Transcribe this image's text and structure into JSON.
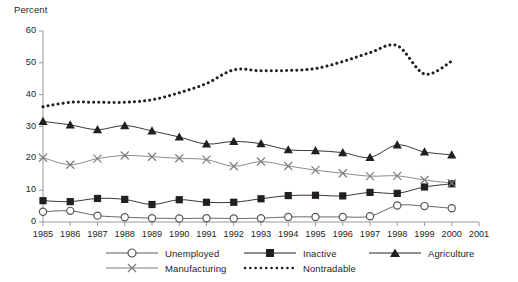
{
  "chart_data": {
    "type": "line",
    "title": "",
    "ylabel": "Percent",
    "xlabel": "",
    "ylim": [
      0,
      60
    ],
    "yticks": [
      0,
      10,
      20,
      30,
      40,
      50,
      60
    ],
    "grid": false,
    "legend_position": "bottom",
    "x": [
      1985,
      1986,
      1987,
      1988,
      1989,
      1990,
      1991,
      1992,
      1993,
      1994,
      1995,
      1996,
      1997,
      1998,
      1999,
      2000
    ],
    "xtick_labels": [
      "1985",
      "1986",
      "1987",
      "1988",
      "1989",
      "1990",
      "1991",
      "1992",
      "1993",
      "1994",
      "1995",
      "1996",
      "1997",
      "1998",
      "1999",
      "2000",
      "2001"
    ],
    "xlim": [
      1985,
      2001
    ],
    "series": [
      {
        "name": "Unemployed",
        "marker": "circle-open",
        "line": "solid",
        "color": "#58585b",
        "values": [
          3.2,
          3.5,
          2.0,
          1.5,
          1.2,
          1.1,
          1.2,
          1.1,
          1.2,
          1.6,
          1.6,
          1.6,
          1.8,
          5.2,
          5.0,
          4.3
        ]
      },
      {
        "name": "Inactive",
        "marker": "square-filled",
        "line": "solid",
        "color": "#231f20",
        "values": [
          6.7,
          6.4,
          7.4,
          7.1,
          5.5,
          7.0,
          6.2,
          6.2,
          7.3,
          8.3,
          8.4,
          8.2,
          9.3,
          9.0,
          11.0,
          12.0
        ]
      },
      {
        "name": "Agriculture",
        "marker": "triangle-filled",
        "line": "solid",
        "color": "#231f20",
        "values": [
          31.6,
          30.5,
          29.0,
          30.3,
          28.6,
          26.7,
          24.5,
          25.3,
          24.6,
          22.7,
          22.4,
          21.8,
          20.3,
          24.2,
          22.0,
          21.1
        ]
      },
      {
        "name": "Manufacturing",
        "marker": "cross-x",
        "line": "solid",
        "color": "#7f7f83",
        "values": [
          20.2,
          18.0,
          19.9,
          20.9,
          20.5,
          20.0,
          19.6,
          17.5,
          19.0,
          17.6,
          16.3,
          15.3,
          14.4,
          14.5,
          13.2,
          12.2
        ]
      },
      {
        "name": "Nontradable",
        "marker": "none",
        "line": "dotted",
        "color": "#231f20",
        "values": [
          36.2,
          37.6,
          37.6,
          37.6,
          38.4,
          40.6,
          43.5,
          47.8,
          47.5,
          47.6,
          48.2,
          50.4,
          53.2,
          55.4,
          46.5,
          50.5
        ]
      }
    ]
  },
  "legend": {
    "entries": [
      {
        "label": "Unemployed",
        "marker": "circle-open"
      },
      {
        "label": "Inactive",
        "marker": "square-filled"
      },
      {
        "label": "Agriculture",
        "marker": "triangle-filled"
      },
      {
        "label": "Manufacturing",
        "marker": "cross-x"
      },
      {
        "label": "Nontradable",
        "marker": "dotted-line"
      }
    ]
  }
}
